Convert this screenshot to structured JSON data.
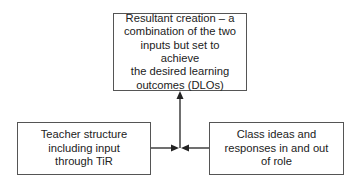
{
  "diagram": {
    "nodes": {
      "result": {
        "label": "Resultant creation – a combination of the two inputs but set to achieve the desired learning outcomes (DLOs)",
        "lines": [
          "Resultant creation – a",
          "combination of the two",
          "inputs but set to achieve",
          "the desired learning",
          "outcomes (DLOs)"
        ]
      },
      "teacher": {
        "label": "Teacher structure including input through TiR",
        "lines": [
          "Teacher structure",
          "including input",
          "through TiR"
        ]
      },
      "class": {
        "label": "Class ideas and responses in and out of role",
        "lines": [
          "Class ideas and",
          "responses in and out",
          "of role"
        ]
      }
    },
    "edges": [
      {
        "from": "teacher",
        "to": "junction"
      },
      {
        "from": "class",
        "to": "junction"
      },
      {
        "from": "junction",
        "to": "result"
      }
    ],
    "colors": {
      "border": "#555555",
      "arrow": "#222222",
      "text": "#222222",
      "background": "#ffffff"
    }
  }
}
